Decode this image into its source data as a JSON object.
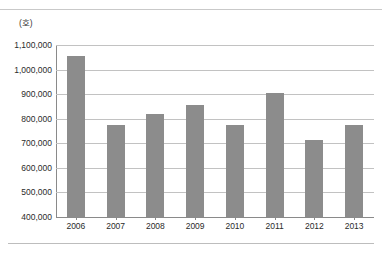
{
  "header": {
    "clipped_text": "ᅟ ᅟ ᅟ ᅟ ᅟ ᅟ ᅟ"
  },
  "unit": "(호)",
  "chart_data": {
    "type": "bar",
    "title": "",
    "xlabel": "",
    "ylabel": "(호)",
    "categories": [
      "2006",
      "2007",
      "2008",
      "2009",
      "2010",
      "2011",
      "2012",
      "2013"
    ],
    "values": [
      1055000,
      775000,
      818000,
      855000,
      775000,
      905000,
      715000,
      775000
    ],
    "ylim": [
      400000,
      1100000
    ],
    "ytick_values": [
      400000,
      500000,
      600000,
      700000,
      800000,
      900000,
      1000000,
      1100000
    ],
    "ytick_labels": [
      "400,000",
      "500,000",
      "600,000",
      "700,000",
      "800,000",
      "900,000",
      "1,000,000",
      "1,100,000"
    ],
    "grid": true,
    "legend": "none",
    "bar_color": "#8c8c8c",
    "grid_color": "#c2c2c2",
    "axis_color": "#8a8a8a"
  }
}
